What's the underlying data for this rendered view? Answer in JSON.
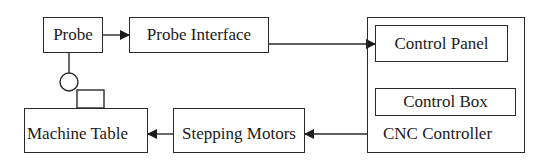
{
  "diagram": {
    "title": "",
    "nodes": {
      "probe": {
        "label": "Probe"
      },
      "probe_interface": {
        "label": "Probe Interface"
      },
      "cnc_controller": {
        "label": "CNC Controller"
      },
      "control_panel": {
        "label": "Control Panel"
      },
      "control_box": {
        "label": "Control Box"
      },
      "stepping_motors": {
        "label": "Stepping Motors"
      },
      "machine_table": {
        "label": "Machine Table"
      }
    },
    "edges": [
      {
        "from": "Probe",
        "to": "Probe Interface",
        "type": "arrow"
      },
      {
        "from": "Probe Interface",
        "to": "Control Panel",
        "type": "arrow"
      },
      {
        "from": "CNC Controller",
        "to": "Stepping Motors",
        "type": "arrow"
      },
      {
        "from": "Stepping Motors",
        "to": "Machine Table",
        "type": "arrow"
      },
      {
        "from": "Probe",
        "to": "Machine Table",
        "type": "stylus-contact"
      }
    ],
    "colors": {
      "stroke": "#2a2a2a",
      "text": "#1a1a1a",
      "background": "#ffffff"
    }
  }
}
